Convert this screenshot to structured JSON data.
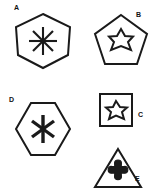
{
  "figure": {
    "title": "",
    "background_color": "#ffffff",
    "stroke_color": "#1a1a1a",
    "label_color": "#111111",
    "panel_count": 5
  },
  "panels": [
    {
      "id": "a",
      "label": "A",
      "label_position": "top-left",
      "outer_shape": "heptagon",
      "outer_sides": 7,
      "inner_shape": "asterisk",
      "inner_spokes": 8,
      "inner_style": "line-spokes",
      "stroke_color": "#1a1a1a"
    },
    {
      "id": "b",
      "label": "B",
      "label_position": "top-right",
      "outer_shape": "pentagon",
      "outer_sides": 5,
      "inner_shape": "six-pointed-star",
      "inner_points": 6,
      "inner_style": "outline",
      "stroke_color": "#1a1a1a"
    },
    {
      "id": "c",
      "label": "C",
      "label_position": "right",
      "outer_shape": "square",
      "outer_sides": 4,
      "inner_shape": "five-pointed-star",
      "inner_points": 5,
      "inner_style": "outline",
      "stroke_color": "#1a1a1a"
    },
    {
      "id": "d",
      "label": "D",
      "label_position": "top-left",
      "outer_shape": "hexagon",
      "outer_sides": 6,
      "inner_shape": "asterisk",
      "inner_spokes": 6,
      "inner_style": "thick-line-spokes",
      "stroke_color": "#1a1a1a"
    },
    {
      "id": "e",
      "label": "E",
      "label_position": "bottom-right",
      "outer_shape": "triangle",
      "outer_sides": 3,
      "inner_shape": "flared-cross",
      "inner_style": "filled",
      "stroke_color": "#1a1a1a"
    }
  ]
}
